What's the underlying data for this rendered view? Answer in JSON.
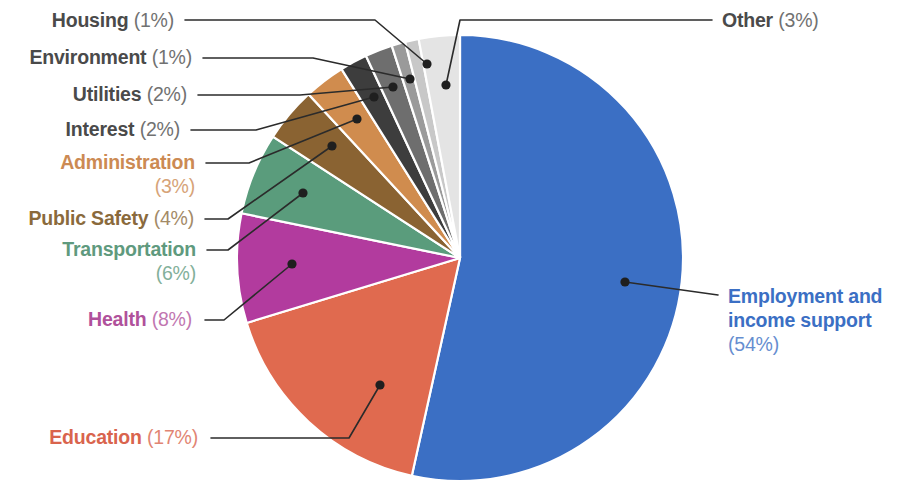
{
  "chart_data": {
    "type": "pie",
    "title": "",
    "legend_position": "callout-labels",
    "units": "percent",
    "categories": [
      "Employment and income support",
      "Education",
      "Health",
      "Transportation",
      "Public Safety",
      "Administration",
      "Interest",
      "Utilities",
      "Environment",
      "Housing",
      "Other"
    ],
    "values": [
      54,
      17,
      8,
      6,
      4,
      3,
      2,
      2,
      1,
      1,
      3
    ],
    "colors": [
      "#3b6fc4",
      "#e06a4f",
      "#b23b9e",
      "#5a9c7c",
      "#8a6332",
      "#d08c4e",
      "#3d3d3d",
      "#6e6e6e",
      "#9a9a9a",
      "#c8c8c8",
      "#e4e4e4"
    ],
    "slices": [
      {
        "label": "Employment and income support",
        "value": 54,
        "display": "(54%)",
        "color": "#3b6fc4",
        "label_color": "#3b6fc4"
      },
      {
        "label": "Education",
        "value": 17,
        "display": "(17%)",
        "color": "#e06a4f",
        "label_color": "#d9644d"
      },
      {
        "label": "Health",
        "value": 8,
        "display": "(8%)",
        "color": "#b23b9e",
        "label_color": "#b0519b"
      },
      {
        "label": "Transportation",
        "value": 6,
        "display": "(6%)",
        "color": "#5a9c7c",
        "label_color": "#5f9a7e"
      },
      {
        "label": "Public Safety",
        "value": 4,
        "display": "(4%)",
        "color": "#8a6332",
        "label_color": "#8a6a3c"
      },
      {
        "label": "Administration",
        "value": 3,
        "display": "(3%)",
        "color": "#d08c4e",
        "label_color": "#cc8a53"
      },
      {
        "label": "Interest",
        "value": 2,
        "display": "(2%)",
        "color": "#3d3d3d",
        "label_color": "#4a4a4a"
      },
      {
        "label": "Utilities",
        "value": 2,
        "display": "(2%)",
        "color": "#6e6e6e",
        "label_color": "#4a4a4a"
      },
      {
        "label": "Environment",
        "value": 1,
        "display": "(1%)",
        "color": "#9a9a9a",
        "label_color": "#4a4a4a"
      },
      {
        "label": "Housing",
        "value": 1,
        "display": "(1%)",
        "color": "#c8c8c8",
        "label_color": "#4a4a4a"
      },
      {
        "label": "Other",
        "value": 3,
        "display": "(3%)",
        "color": "#e4e4e4",
        "label_color": "#4a4a4a"
      }
    ]
  },
  "labels": {
    "housing": {
      "name": "Housing",
      "pct": "(1%)"
    },
    "environment": {
      "name": "Environment",
      "pct": "(1%)"
    },
    "utilities": {
      "name": "Utilities",
      "pct": "(2%)"
    },
    "interest": {
      "name": "Interest",
      "pct": "(2%)"
    },
    "administration": {
      "name": "Administration",
      "pct": "(3%)"
    },
    "public_safety": {
      "name": "Public Safety",
      "pct": "(4%)"
    },
    "transportation": {
      "name": "Transportation",
      "pct": "(6%)"
    },
    "health": {
      "name": "Health",
      "pct": "(8%)"
    },
    "education": {
      "name": "Education",
      "pct": "(17%)"
    },
    "other": {
      "name": "Other",
      "pct": "(3%)"
    },
    "employment": {
      "name": "Employment and",
      "name2": "income support",
      "pct": "(54%)"
    }
  }
}
